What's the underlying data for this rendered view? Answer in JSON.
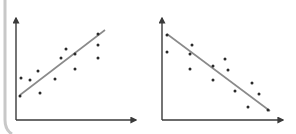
{
  "figure": {
    "colors": {
      "axis": "#3a3a3a",
      "point": "#2a2a2a",
      "trend_line": "#8a8a8a",
      "frame": "#c8c8c8",
      "background": "#ffffff"
    }
  },
  "chart_data": [
    {
      "type": "scatter",
      "title": "",
      "xlabel": "",
      "ylabel": "",
      "trend": "positive",
      "grid": false,
      "axes_arrows": true,
      "points_px": [
        [
          20,
          96
        ],
        [
          21,
          78
        ],
        [
          30,
          80
        ],
        [
          38,
          71
        ],
        [
          40,
          93
        ],
        [
          55,
          79
        ],
        [
          61,
          58
        ],
        [
          66,
          49
        ],
        [
          75,
          54
        ],
        [
          75,
          69
        ],
        [
          98,
          34
        ],
        [
          98,
          45
        ],
        [
          98,
          58
        ]
      ],
      "trend_line_px": [
        [
          20,
          95
        ],
        [
          105,
          30
        ]
      ],
      "axes_px": {
        "origin": [
          16,
          120
        ],
        "y_top": [
          16,
          18
        ],
        "x_right": [
          136,
          120
        ]
      }
    },
    {
      "type": "scatter",
      "title": "",
      "xlabel": "",
      "ylabel": "",
      "trend": "negative",
      "grid": false,
      "axes_arrows": true,
      "points_px": [
        [
          167,
          35
        ],
        [
          167,
          52
        ],
        [
          190,
          54
        ],
        [
          192,
          45
        ],
        [
          190,
          69
        ],
        [
          213,
          66
        ],
        [
          213,
          80
        ],
        [
          225,
          59
        ],
        [
          228,
          70
        ],
        [
          235,
          91
        ],
        [
          252,
          83
        ],
        [
          248,
          107
        ],
        [
          259,
          94
        ],
        [
          268,
          110
        ]
      ],
      "trend_line_px": [
        [
          167,
          34
        ],
        [
          270,
          111
        ]
      ],
      "axes_px": {
        "origin": [
          162,
          120
        ],
        "y_top": [
          162,
          18
        ],
        "x_right": [
          283,
          120
        ]
      }
    }
  ]
}
